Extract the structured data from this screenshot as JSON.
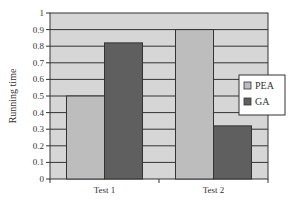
{
  "chart_data": {
    "type": "bar",
    "title": "",
    "xlabel": "",
    "ylabel": "Running time",
    "ylim": [
      0,
      1
    ],
    "yticks": [
      0,
      0.1,
      0.2,
      0.3,
      0.4,
      0.5,
      0.6,
      0.7,
      0.8,
      0.9,
      1
    ],
    "ytick_labels": [
      "0",
      "0.1",
      "0.2",
      "0.3",
      "0.4",
      "0.5",
      "0.6",
      "0.7",
      "0.8",
      "0.9",
      "1"
    ],
    "categories": [
      "Test 1",
      "Test 2"
    ],
    "series": [
      {
        "name": "PEA",
        "values": [
          0.5,
          0.9
        ],
        "color": "#bdbdbd"
      },
      {
        "name": "GA",
        "values": [
          0.82,
          0.32
        ],
        "color": "#5f5f5f"
      }
    ],
    "grid": true,
    "legend_position": "right",
    "plot_background": "#d6d6d6"
  }
}
